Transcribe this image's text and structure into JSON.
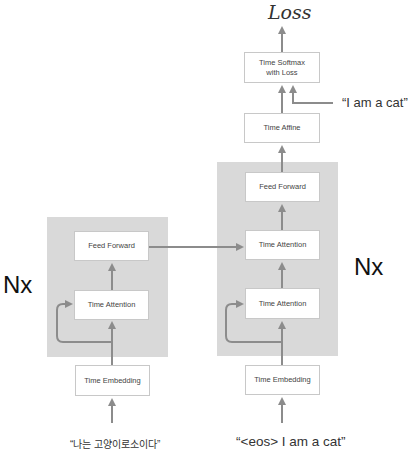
{
  "title": "Loss",
  "encoder": {
    "repeat_label": "Nx",
    "blocks": {
      "feed_forward": "Feed Forward",
      "time_attention": "Time Attention"
    },
    "embedding": "Time Embedding",
    "input_text": "“나는 고양이로소이다”"
  },
  "decoder": {
    "repeat_label": "Nx",
    "blocks": {
      "feed_forward": "Feed Forward",
      "cross_attention": "Time Attention",
      "self_attention": "Time Attention"
    },
    "embedding": "Time Embedding",
    "input_text": "“<eos> I am a cat”",
    "affine": "Time Affine",
    "softmax_line1": "Time Softmax",
    "softmax_line2": "with Loss",
    "target_text": "“I am a cat”"
  },
  "colors": {
    "panel": "#d9d9d9",
    "arrow": "#8c8c8c",
    "box_border": "#c8c8c8"
  }
}
